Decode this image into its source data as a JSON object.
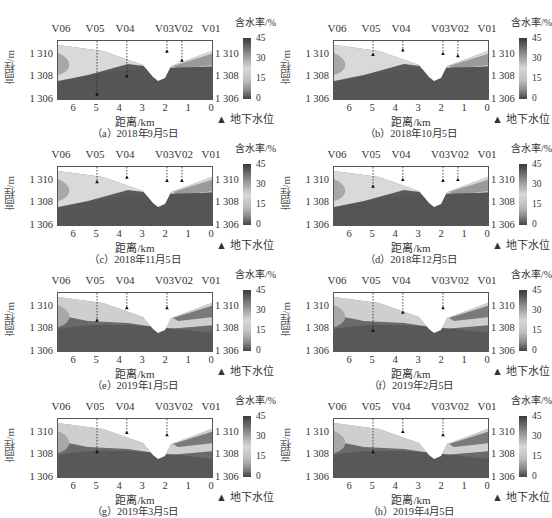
{
  "figure": {
    "colorbar": {
      "title": "含水率/%",
      "ticks": [
        "45",
        "30",
        "15",
        "0"
      ]
    },
    "legend": {
      "symbol": "▲",
      "label": "地下水位"
    },
    "ylabel": "高程/m",
    "xlabel": "距离/km",
    "yticks": [
      "1 310",
      "1 308",
      "1 306"
    ],
    "xticks": [
      "6",
      "5",
      "4",
      "3",
      "2",
      "1",
      "0"
    ],
    "wells": [
      "V06",
      "V05",
      "V04",
      "V03V02",
      "V01"
    ]
  },
  "panels": [
    {
      "caption": "（a）2018年9月5日"
    },
    {
      "caption": "（b）2018年10月5日"
    },
    {
      "caption": "（c）2018年11月5日"
    },
    {
      "caption": "（d）2018年12月5日"
    },
    {
      "caption": "（e）2019年1月5日"
    },
    {
      "caption": "（f）2019年2月5日"
    },
    {
      "caption": "（g）2019年3月5日"
    },
    {
      "caption": "（h）2019年4月5日"
    }
  ],
  "chart_data": {
    "type": "heatmap",
    "title": "",
    "xlabel": "距离/km",
    "ylabel": "高程/m",
    "xlim": [
      6.8,
      0
    ],
    "ylim": [
      1306,
      1311.3
    ],
    "x_ticks": [
      6,
      5,
      4,
      3,
      2,
      1,
      0
    ],
    "y_ticks": [
      1306,
      1308,
      1310
    ],
    "colorbar": {
      "label": "含水率/%",
      "range": [
        0,
        45
      ],
      "ticks": [
        0,
        15,
        30,
        45
      ]
    },
    "wells": [
      {
        "name": "V06",
        "x_km": 6.8
      },
      {
        "name": "V05",
        "x_km": 5.1
      },
      {
        "name": "V04",
        "x_km": 3.8
      },
      {
        "name": "V03",
        "x_km": 2.05
      },
      {
        "name": "V02",
        "x_km": 1.4
      },
      {
        "name": "V01",
        "x_km": 0
      }
    ],
    "legend": [
      "地下水位 (▲ groundwater level)"
    ],
    "panels": [
      {
        "label": "(a)",
        "date": "2018-09-05",
        "groundwater_level_m": {
          "V05": 1306.6,
          "V04": 1308.2,
          "V03": 1310.4,
          "V02": 1309.6
        }
      },
      {
        "label": "(b)",
        "date": "2018-10-05",
        "groundwater_level_m": {
          "V05": 1310.1,
          "V04": 1310.5,
          "V03": 1310.2,
          "V02": 1310.0
        }
      },
      {
        "label": "(c)",
        "date": "2018-11-05",
        "groundwater_level_m": {
          "V05": 1310.0,
          "V04": 1310.4,
          "V03": 1310.1,
          "V02": 1310.1
        }
      },
      {
        "label": "(d)",
        "date": "2018-12-05",
        "groundwater_level_m": {
          "V05": 1309.6,
          "V04": 1310.2,
          "V03": 1310.1,
          "V02": 1310.2
        }
      },
      {
        "label": "(e)",
        "date": "2019-01-05",
        "groundwater_level_m": {
          "V05": 1308.9,
          "V04": 1310.0,
          "V03": 1310.0
        }
      },
      {
        "label": "(f)",
        "date": "2019-02-05",
        "groundwater_level_m": {
          "V05": 1308.0,
          "V04": 1309.6,
          "V03": 1310.0
        }
      },
      {
        "label": "(g)",
        "date": "2019-03-05",
        "groundwater_level_m": {
          "V05": 1308.4,
          "V04": 1310.1,
          "V03": 1309.9
        }
      },
      {
        "label": "(h)",
        "date": "2019-04-05",
        "groundwater_level_m": {
          "V05": 1308.4,
          "V04": 1310.2,
          "V03": 1309.9
        }
      }
    ]
  }
}
